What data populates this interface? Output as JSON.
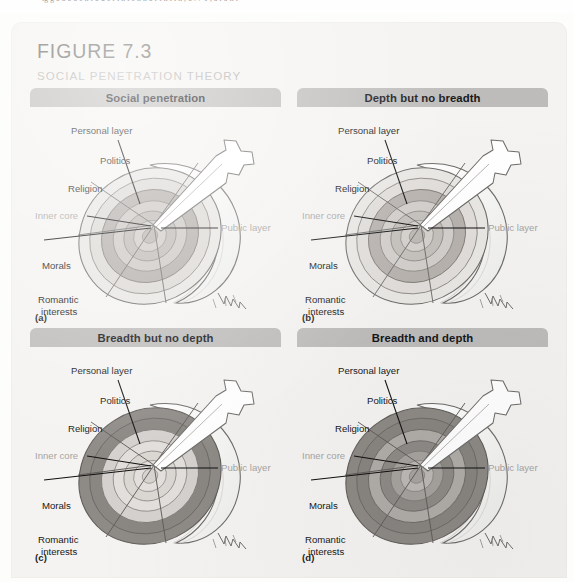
{
  "page_bleed": {
    "text": "ig g  o a o o e   n i  o u e r  i   n i e  n   n o  r   i     n i i n ,  o . 7 1 ,  a i o n i"
  },
  "figure": {
    "number": "FIGURE 7.3",
    "subtitle": "SOCIAL PENETRATION THEORY"
  },
  "colors": {
    "card_background": "#f4f3f1",
    "panel_title_bar": "#bdbcba",
    "panel_title_text": "#16161a",
    "figure_number_text": "#66645f",
    "figure_subtitle_text": "#b2b0ac",
    "label_text": "#181818",
    "muted_label_text": "#a7a5a2",
    "onion_outline": "#6e6c69",
    "ring_light": "#e3e1de",
    "ring_mid": "#c9c6c2",
    "ring_dark": "#9b9794",
    "ring_darker": "#858180",
    "onion_body": "#fbfaf8",
    "knife_blade": "#ffffff"
  },
  "labels": {
    "personal_layer": "Personal layer",
    "politics": "Politics",
    "religion": "Religion",
    "inner_core": "Inner core",
    "public_layer": "Public layer",
    "morals": "Morals",
    "romantic_interests_line1": "Romantic",
    "romantic_interests_line2": "interests"
  },
  "panels": [
    {
      "letter": "(a)",
      "title": "Social penetration",
      "description": "Onion diagram with a wedge cut showing both breadth and depth of penetration, rings lightly shaded"
    },
    {
      "letter": "(b)",
      "title": "Depth but no breadth",
      "description": "Narrow wedge reaching the inner core; only a thin slice of each layer is shaded"
    },
    {
      "letter": "(c)",
      "title": "Breadth but no depth",
      "description": "Outer layer shaded all the way around, but the cut does not reach the inner core"
    },
    {
      "letter": "(d)",
      "title": "Breadth and depth",
      "description": "All layers shaded around the full circumference and penetrating to the inner core"
    }
  ]
}
